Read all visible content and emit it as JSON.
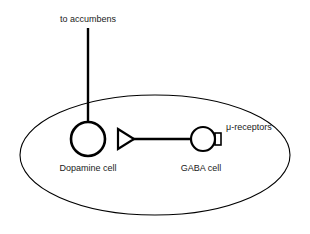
{
  "diagram": {
    "type": "neuroanatomical-circuit-schematic",
    "background_color": "#ffffff",
    "stroke_color": "#000000",
    "text_color": "#1a1a1a",
    "labels": {
      "projection": "to accumbens",
      "dopamine_cell": "Dopamine cell",
      "gaba_cell": "GABA cell",
      "receptors": "μ-receptors"
    },
    "nodes": [
      {
        "id": "dopamine-cell",
        "shape": "circle",
        "label": "Dopamine cell",
        "cx": 88,
        "cy": 139,
        "r": 17,
        "stroke_width": 2.6,
        "fill": "none"
      },
      {
        "id": "gaba-cell",
        "shape": "circle",
        "label": "GABA cell",
        "cx": 203,
        "cy": 139,
        "r": 12,
        "stroke_width": 2.2,
        "fill": "none"
      },
      {
        "id": "mu-receptor",
        "shape": "rectangle",
        "label": "μ-receptors",
        "x": 215,
        "y": 133,
        "width": 6,
        "height": 12,
        "stroke_width": 1.6,
        "fill": "none"
      },
      {
        "id": "enclosing-region",
        "shape": "ellipse",
        "cx": 155,
        "cy": 155,
        "rx": 135,
        "ry": 60,
        "stroke_width": 1.1,
        "fill": "none"
      }
    ],
    "edges": [
      {
        "id": "accumbens-projection",
        "from": "dopamine-cell",
        "to": "to accumbens",
        "kind": "axon-line",
        "x1": 88,
        "y1": 28,
        "x2": 88,
        "y2": 122,
        "stroke_width": 2.4
      },
      {
        "id": "gaba-to-dopamine",
        "from": "gaba-cell",
        "to": "dopamine-cell",
        "kind": "inhibitory-projection",
        "x1": 191,
        "y1": 139,
        "x2": 131,
        "y2": 139,
        "stroke_width": 2.4,
        "terminal": "open-triangle-arrowhead"
      }
    ],
    "arrowhead": {
      "id": "triangle-terminal",
      "direction": "right",
      "points": "118,129 134,139 118,149",
      "fill": "none",
      "stroke_width": 2.2
    }
  }
}
